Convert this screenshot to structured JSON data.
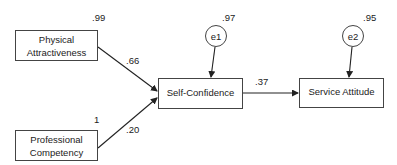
{
  "diagram": {
    "nodes": {
      "physical_attractiveness": {
        "label": "Physical Attractiveness",
        "line1": "Physical",
        "line2": "Attractiveness",
        "variance": ".99"
      },
      "professional_competency": {
        "label": "Professional Competency",
        "line1": "Professional",
        "line2": "Competency",
        "variance": "1"
      },
      "self_confidence": {
        "label": "Self-Confidence",
        "r2": ".97"
      },
      "service_attitude": {
        "label": "Service Attitude",
        "r2": ".95"
      },
      "e1": {
        "label": "e1"
      },
      "e2": {
        "label": "e2"
      }
    },
    "paths": [
      {
        "from": "Physical Attractiveness",
        "to": "Self-Confidence",
        "coef": ".66"
      },
      {
        "from": "Professional Competency",
        "to": "Self-Confidence",
        "coef": ".20"
      },
      {
        "from": "Self-Confidence",
        "to": "Service Attitude",
        "coef": ".37"
      },
      {
        "from": "e1",
        "to": "Self-Confidence",
        "coef": ""
      },
      {
        "from": "e2",
        "to": "Service Attitude",
        "coef": ""
      }
    ]
  }
}
